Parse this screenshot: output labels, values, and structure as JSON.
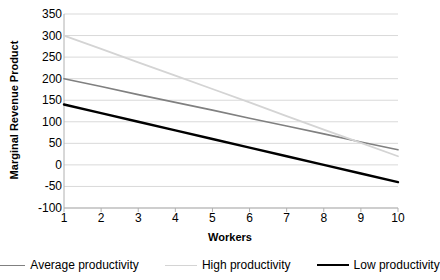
{
  "chart_data": {
    "type": "line",
    "title": "",
    "xlabel": "Workers",
    "ylabel": "Marginal Revenue Product",
    "x": [
      1,
      2,
      3,
      4,
      5,
      6,
      7,
      8,
      9,
      10
    ],
    "xtick_labels": [
      "1",
      "2",
      "3",
      "4",
      "5",
      "6",
      "7",
      "8",
      "9",
      "10"
    ],
    "ytick_labels": [
      "350",
      "300",
      "250",
      "200",
      "150",
      "100",
      "50",
      "0",
      "-50",
      "-100"
    ],
    "ytick_values": [
      350,
      300,
      250,
      200,
      150,
      100,
      50,
      0,
      -50,
      -100
    ],
    "ylim": [
      -100,
      350
    ],
    "xlim": [
      1,
      10
    ],
    "grid": true,
    "grid_axis": "y",
    "legend_position": "bottom",
    "series": [
      {
        "name": "Average productivity",
        "color": "#808080",
        "width": 1.6,
        "values": [
          200,
          182,
          163,
          145,
          127,
          108,
          90,
          72,
          53,
          35
        ]
      },
      {
        "name": "High productivity",
        "color": "#d4d4d4",
        "width": 1.8,
        "values": [
          300,
          269,
          238,
          207,
          176,
          145,
          113,
          82,
          51,
          20
        ]
      },
      {
        "name": "Low productivity",
        "color": "#000000",
        "width": 2.4,
        "values": [
          140,
          120,
          100,
          80,
          60,
          40,
          20,
          0,
          -20,
          -40
        ]
      }
    ]
  },
  "axes": {
    "axis_line_color": "#b0b0b0",
    "grid_color": "#d9d9d9"
  }
}
